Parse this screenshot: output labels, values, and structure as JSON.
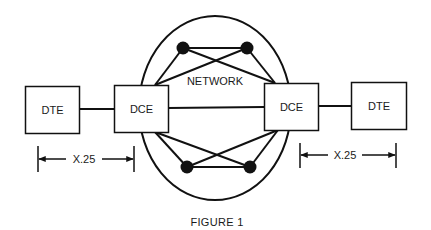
{
  "diagram": {
    "colors": {
      "stroke": "#111111",
      "background": "#ffffff",
      "text": "#1a1a1a"
    },
    "network": {
      "label": "NETWORK",
      "node_count": 4
    },
    "boxes": [
      {
        "id": "dte-left",
        "label": "DTE"
      },
      {
        "id": "dce-left",
        "label": "DCE"
      },
      {
        "id": "dce-right",
        "label": "DCE"
      },
      {
        "id": "dte-right",
        "label": "DTE"
      }
    ],
    "dimensions": [
      {
        "id": "x25-left",
        "label": "X.25"
      },
      {
        "id": "x25-right",
        "label": "X.25"
      }
    ],
    "caption": "FIGURE 1"
  }
}
